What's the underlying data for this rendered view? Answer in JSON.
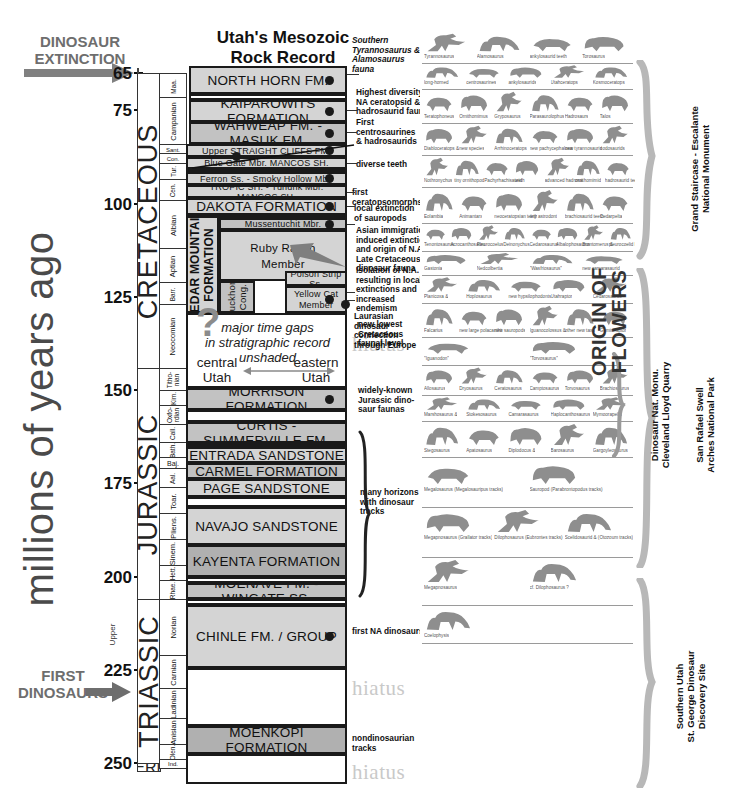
{
  "title": {
    "line1": "Utah's Mesozoic",
    "line2": "Rock Record"
  },
  "axis": {
    "label": "millions of years ago",
    "ticks": [
      65,
      75,
      100,
      125,
      150,
      175,
      200,
      225,
      250
    ],
    "tick_labels": [
      "65",
      "75",
      "100",
      "125",
      "150",
      "175",
      "200",
      "225",
      "250"
    ],
    "unit": "Ma",
    "range": [
      65,
      252
    ]
  },
  "callouts": {
    "extinction": {
      "l1": "DINOSAUR",
      "l2": "EXTINCTION"
    },
    "first": {
      "l1": "FIRST",
      "l2": "DINOSAURS"
    }
  },
  "periods": [
    {
      "name": "CRETACEOUS",
      "top": 65,
      "bottom": 144
    },
    {
      "name": "JURASSIC",
      "top": 144,
      "bottom": 206
    },
    {
      "name": "TRIASSIC",
      "top": 206,
      "bottom": 250
    },
    {
      "name": "PERM.",
      "top": 250,
      "bottom": 252
    }
  ],
  "upper_label": "Upper",
  "stages": [
    {
      "label": "Maa.",
      "top": 65,
      "bottom": 71.5
    },
    {
      "label": "Campanian",
      "top": 71.5,
      "bottom": 84
    },
    {
      "label": "Sant.",
      "top": 84,
      "bottom": 86.5
    },
    {
      "label": "Con.",
      "top": 86.5,
      "bottom": 89
    },
    {
      "label": "Tur.",
      "top": 89,
      "bottom": 93.5
    },
    {
      "label": "Cen.",
      "top": 93.5,
      "bottom": 99
    },
    {
      "label": "Albian",
      "top": 99,
      "bottom": 112
    },
    {
      "label": "Aptian",
      "top": 112,
      "bottom": 121
    },
    {
      "label": "Barr.",
      "top": 121,
      "bottom": 127
    },
    {
      "label": "Neocomian",
      "top": 127,
      "bottom": 144
    },
    {
      "label": "Titho-nian",
      "top": 144,
      "bottom": 150
    },
    {
      "label": "Kim.",
      "top": 150,
      "bottom": 154
    },
    {
      "label": "Oxfo-rdian",
      "top": 154,
      "bottom": 159
    },
    {
      "label": "Call.",
      "top": 159,
      "bottom": 164
    },
    {
      "label": "Bath.",
      "top": 164,
      "bottom": 168
    },
    {
      "label": "Baj.",
      "top": 168,
      "bottom": 171
    },
    {
      "label": "Aal.",
      "top": 171,
      "bottom": 176
    },
    {
      "label": "Toar.",
      "top": 176,
      "bottom": 183
    },
    {
      "label": "Pliens.",
      "top": 183,
      "bottom": 190
    },
    {
      "label": "Sinem.",
      "top": 190,
      "bottom": 197
    },
    {
      "label": "Hett.",
      "top": 197,
      "bottom": 201
    },
    {
      "label": "Rhae.",
      "top": 201,
      "bottom": 206
    },
    {
      "label": "Norian",
      "top": 206,
      "bottom": 221
    },
    {
      "label": "Carnian",
      "top": 221,
      "bottom": 230
    },
    {
      "label": "Ladinian",
      "top": 230,
      "bottom": 238
    },
    {
      "label": "Anisian",
      "top": 238,
      "bottom": 245
    },
    {
      "label": "Olen.",
      "top": 245,
      "bottom": 249
    },
    {
      "label": "Ind.",
      "top": 249,
      "bottom": 251
    }
  ],
  "formations": [
    {
      "name": "NORTH HORN FM.",
      "shade": "sh-lt",
      "dot": true,
      "size": ""
    },
    {
      "name": "KAIPAROWITS FORMATION",
      "shade": "sh-lt",
      "dot": true,
      "size": ""
    },
    {
      "name": "WAHWEAP FM. - MASUK FM.",
      "shade": "sh-md",
      "dot": true,
      "size": ""
    },
    {
      "name": "Upper STRAIGHT CLIFFS FM.",
      "shade": "sh-lt",
      "dot": true,
      "size": "sm"
    },
    {
      "name": "Blue Gate Mbr. MANCOS SH.",
      "shade": "sh-lt",
      "dot": false,
      "size": "sm"
    },
    {
      "name": "Ferron Ss.   -   Smoky Hollow Mbr.",
      "shade": "sh-lt",
      "dot": true,
      "size": "sm"
    },
    {
      "name": "TROPIC SH. - Tununk Mbr.  MANCOS SH.",
      "shade": "sh-lt",
      "dot": false,
      "size": "sm"
    },
    {
      "name": "DAKOTA FORMATION",
      "shade": "sh-lt",
      "dot": true,
      "size": ""
    },
    {
      "name": "Mussentuchit Mbr.",
      "shade": "sh-md",
      "dot": true,
      "size": "sm"
    },
    {
      "name": "Ruby Ranch Member",
      "shade": "sh-lt",
      "dot": false,
      "size": "md"
    },
    {
      "name": "CEDAR MOUNTAIN FORMATION",
      "shade": "sh-lt",
      "dot": false,
      "size": "vert"
    },
    {
      "name": "Buckhorn Cong.",
      "shade": "sh-md",
      "dot": false,
      "size": "vert2"
    },
    {
      "name": "Poison Strip Ss.",
      "shade": "sh-lt",
      "dot": false,
      "size": "sm"
    },
    {
      "name": "Yellow Cat Member",
      "shade": "sh-lt",
      "dot": true,
      "size": "sm"
    },
    {
      "name": "MORRISON FORMATION",
      "shade": "sh-md",
      "dot": true,
      "size": ""
    },
    {
      "name": "CURTIS - SUMMERVILLE FM.",
      "shade": "sh-md",
      "dot": false,
      "size": ""
    },
    {
      "name": "ENTRADA SANDSTONE",
      "shade": "sh-lt",
      "dot": false,
      "size": ""
    },
    {
      "name": "CARMEL FORMATION",
      "shade": "sh-md",
      "dot": false,
      "size": ""
    },
    {
      "name": "PAGE SANDSTONE",
      "shade": "sh-lt",
      "dot": false,
      "size": ""
    },
    {
      "name": "NAVAJO SANDSTONE",
      "shade": "sh-lt",
      "dot": false,
      "size": ""
    },
    {
      "name": "KAYENTA FORMATION",
      "shade": "sh-dk",
      "dot": false,
      "size": ""
    },
    {
      "name": "MOENAVE FM. - WINGATE SS.",
      "shade": "sh-md",
      "dot": false,
      "size": ""
    },
    {
      "name": "CHINLE FM. / GROUP",
      "shade": "sh-lt",
      "dot": true,
      "size": ""
    },
    {
      "name": "MOENKOPI FORMATION",
      "shade": "sh-dk",
      "dot": false,
      "size": ""
    }
  ],
  "gap_note": {
    "l1": "major time gaps",
    "l2": "in stratigraphic record",
    "l3": "unshaded",
    "left1": "central",
    "left2": "Utah",
    "right1": "eastern",
    "right2": "Utah",
    "question": "?"
  },
  "hiatus_label": "hiatus",
  "annotations": [
    {
      "text": "Southern\nTyrannosaurus &\nAlamosaurus fauna",
      "italic": true
    },
    {
      "text": "Highest diversity\nNA ceratopsid &\nhadrosaurid fauna",
      "italic": false
    },
    {
      "text": "First\ncentrosaurines\n& hadrosaurids",
      "italic": false
    },
    {
      "text": "diverse teeth",
      "italic": false
    },
    {
      "text": "first ceratopsomorphs",
      "italic": false
    },
    {
      "text": "local extinction\nof sauropods",
      "italic": false
    },
    {
      "text": "Asian immigration\ninduced extinction\nand origin of N.A.\nLate Cretaceous\ndinosaur fauna",
      "italic": false
    },
    {
      "text": "Isolation of N.A.\nresulting in local\nextinctions and\nincreased\nendemism",
      "italic": false
    },
    {
      "text": "Laurasian dinosaur\nconnection\nthrough Europe",
      "italic": false
    },
    {
      "text": "new lowest\nCretaceous\nfaunal level",
      "italic": false
    },
    {
      "text": "widely-known\nJurassic dino-\nsaur faunas",
      "italic": false
    },
    {
      "text": "many horizons\nwith dinosaur\ntracks",
      "italic": false
    },
    {
      "text": "first NA dinosaurs",
      "italic": false
    },
    {
      "text": "nondinosaurian tracks",
      "italic": false
    }
  ],
  "right_labels": [
    {
      "text": "Grand Staircase - Escalante\nNational Monument"
    },
    {
      "text": "San Rafael Swell\nArches National Park"
    },
    {
      "text": "Dinosaur Nat. Monu.\nCleveland Lloyd Quarry"
    },
    {
      "text": "Southern Utah\nSt. George Dinosaur\nDiscovery Site"
    }
  ],
  "origin_of_flowers": {
    "l1": "ORIGIN OF",
    "l2": "FLOWERS"
  },
  "fauna_rows": [
    {
      "names": [
        "Tyrannosaurus",
        "Alamosaurus",
        "ankylosaurid teeth",
        "Torosaurus"
      ]
    },
    {
      "names": [
        "long-horned",
        "centrosaurines",
        "ankylosaurids",
        "Utahceratops",
        "Kosmoceratops"
      ]
    },
    {
      "names": [
        "Teratophoneus",
        "Ornithomimus",
        "Gryposaurus",
        "Parasaurolophus",
        "Hadrosaurs",
        "Talos"
      ]
    },
    {
      "names": [
        "Diabloceratops &",
        "new species",
        "Arrhinoceratops",
        "new pachycephalosaurs",
        "new tyrannosaurid",
        "nodosaurids"
      ]
    },
    {
      "names": [
        "Nothronychus",
        "tiny ornithopod",
        "Pachyrhachisaurid",
        "teeth",
        "advanced hadrosauromorphs",
        "ornithomimid",
        "hadrosaurid teeth"
      ]
    },
    {
      "names": [
        "Eolambia",
        "Animantarx",
        "neoceratopsian teeth",
        "tiny astrodont",
        "brachiosaurid teeth",
        "Cedarpelta"
      ]
    },
    {
      "names": [
        "Tenontosaurus",
        "Acrocanthosaurus",
        "Pleurocoelus",
        "Deinonychus",
        "Cedarosaurus",
        "Albalophosaurus",
        "Brontomerus &",
        "pleurocoelid brachiosaurids"
      ]
    },
    {
      "names": [
        "Gastonia",
        "Nedcolbertia",
        "\"Wasfriosaurus\"",
        "new camarasaurid"
      ]
    },
    {
      "names": [
        "Planicoxa &",
        "Hoplosaurus",
        "new hypsilophodonts",
        "Utahraptor",
        "Cedarosaurus"
      ]
    },
    {
      "names": [
        "Falcarius",
        "new large polacanthine ankylosaur",
        "new sauropods",
        "Iguanocolossus &",
        "other new taxa",
        "Geminiraptor"
      ]
    },
    {
      "names": [
        "\"Iguanodon\"",
        "\"Torvosaurus\""
      ]
    },
    {
      "names": [
        "Allosaurus",
        "Dryosaurus",
        "Ceratosaurus",
        "Camptosaurus",
        "Torvosaurus",
        "Brachiosaurus"
      ]
    },
    {
      "names": [
        "Marshosaurus &",
        "Stokesosaurus",
        "Camarasaurus",
        "Haplocanthosaurus",
        "Mymoorapelta"
      ]
    },
    {
      "names": [
        "Stegosaurus",
        "Apatosaurus",
        "Diplodocus &",
        "Barosaurus",
        "Gargoyleosaurus"
      ]
    },
    {
      "names": [
        "Megalosaurus (Megalosauripus tracks)",
        "Sauropod (Parabrontopodus tracks)"
      ]
    },
    {
      "names": [
        "Megapnosaurus (Grallator tracks)",
        "Dilophosaurus (Eubrontes tracks)",
        "Scelidosaurid & (Otozoum tracks)"
      ]
    },
    {
      "names": [
        "Megapnosaurus",
        "cf. Dilophosaurus ?"
      ]
    },
    {
      "names": [
        "Coelophysis"
      ]
    }
  ],
  "colors": {
    "shade_light": "#d4d4d4",
    "shade_mid": "#c2c2c2",
    "shade_dark": "#b0b0b0",
    "ink": "#1a1a1a",
    "gray_text": "#6e6e6e",
    "hiatus": "#c9c9c9"
  }
}
